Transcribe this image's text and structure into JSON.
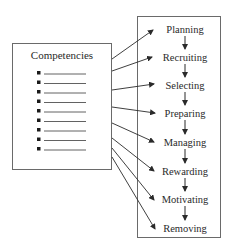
{
  "left_box": {
    "title": "Competencies",
    "bullet_count": 9
  },
  "right_box": {
    "stages": [
      {
        "label": "Planning"
      },
      {
        "label": "Recruiting"
      },
      {
        "label": "Selecting"
      },
      {
        "label": "Preparing"
      },
      {
        "label": "Managing"
      },
      {
        "label": "Rewarding"
      },
      {
        "label": "Motivating"
      },
      {
        "label": "Removing"
      }
    ]
  },
  "colors": {
    "line": "#3a3a3a",
    "box_border": "#6a6a6a",
    "text": "#2a2a2a"
  }
}
